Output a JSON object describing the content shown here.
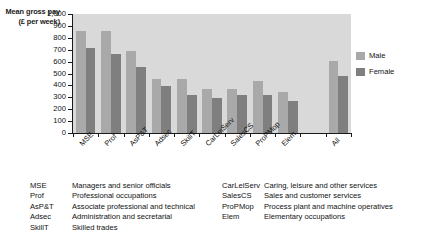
{
  "chart_data": {
    "type": "bar",
    "title": "",
    "ylabel": "Mean gross pay (£ per week)",
    "xlabel": "",
    "ylim": [
      0,
      1000
    ],
    "ytick_values": [
      1000,
      900,
      800,
      700,
      600,
      500,
      400,
      300,
      200,
      100,
      0
    ],
    "ytick_labels": [
      "1,000",
      "900",
      "800",
      "700",
      "600",
      "500",
      "400",
      "300",
      "200",
      "100",
      "0"
    ],
    "grid": false,
    "legend_position": "right",
    "categories": [
      "MSE",
      "Prof",
      "AsP&T",
      "Adsec",
      "SkillT",
      "CarLeiServ",
      "SalesCS",
      "ProPMop",
      "Elem",
      "All"
    ],
    "series": [
      {
        "name": "Male",
        "color": "#a9a9a9",
        "values": [
          860,
          860,
          687,
          450,
          453,
          370,
          372,
          435,
          342,
          602
        ]
      },
      {
        "name": "Female",
        "color": "#7f7f7f",
        "values": [
          715,
          660,
          553,
          397,
          320,
          293,
          320,
          320,
          270,
          482
        ]
      }
    ]
  },
  "legend": {
    "items": [
      {
        "label": "Male",
        "color": "#a9a9a9"
      },
      {
        "label": "Female",
        "color": "#7f7f7f"
      }
    ]
  },
  "key": {
    "left_column": [
      {
        "abbr": "MSE",
        "desc": "Managers and senior officials"
      },
      {
        "abbr": "Prof",
        "desc": "Professional occupations"
      },
      {
        "abbr": "AsP&T",
        "desc": "Associate professional and technical"
      },
      {
        "abbr": "Adsec",
        "desc": "Administration and secretarial"
      },
      {
        "abbr": "SkillT",
        "desc": "Skilled trades"
      }
    ],
    "right_column": [
      {
        "abbr": "CarLeiServ",
        "desc": "Caring, leisure and other services"
      },
      {
        "abbr": "SalesCS",
        "desc": "Sales and customer services"
      },
      {
        "abbr": "ProPMop",
        "desc": "Process plant and machine operatives"
      },
      {
        "abbr": "Elem",
        "desc": "Elementary occupations"
      }
    ]
  }
}
